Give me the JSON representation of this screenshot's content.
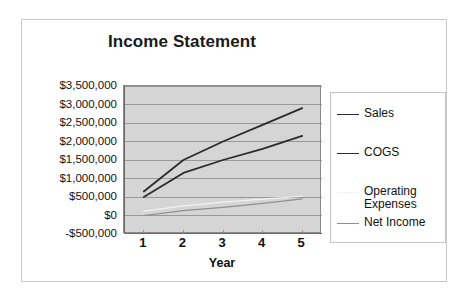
{
  "chart_data": {
    "type": "line",
    "title": "Income Statement",
    "xlabel": "Year",
    "ylabel": "",
    "x": [
      1,
      2,
      3,
      4,
      5
    ],
    "categories": [
      "1",
      "2",
      "3",
      "4",
      "5"
    ],
    "xtick_labels": [
      "1",
      "2",
      "3",
      "4",
      "5"
    ],
    "ytick_labels": [
      "$3,500,000",
      "$3,000,000",
      "$2,500,000",
      "$2,000,000",
      "$1,500,000",
      "$1,000,000",
      "$500,000",
      "$0",
      "-$500,000"
    ],
    "ytick_values": [
      3500000,
      3000000,
      2500000,
      2000000,
      1500000,
      1000000,
      500000,
      0,
      -500000
    ],
    "ylim": [
      -500000,
      3500000
    ],
    "xlim": [
      0.5,
      5.5
    ],
    "grid": true,
    "grid_axis": "y",
    "legend_position": "right",
    "plot_background": "#d5d5d5",
    "series": [
      {
        "name": "Sales",
        "color": "#2b2b2b",
        "width": 1.8,
        "values": [
          650000,
          1500000,
          2000000,
          2450000,
          2900000
        ]
      },
      {
        "name": "COGS",
        "color": "#2b2b2b",
        "width": 1.8,
        "values": [
          500000,
          1150000,
          1500000,
          1800000,
          2150000
        ]
      },
      {
        "name": "Operating\nExpenses",
        "color": "#f2f2f2",
        "width": 1.2,
        "values": [
          120000,
          260000,
          360000,
          440000,
          520000
        ]
      },
      {
        "name": "Net Income",
        "color": "#8f8f8f",
        "width": 1.2,
        "values": [
          0,
          130000,
          220000,
          330000,
          450000
        ]
      }
    ]
  },
  "legend": {
    "entries": [
      {
        "label": "Sales",
        "color": "#2b2b2b"
      },
      {
        "label": "COGS",
        "color": "#2b2b2b"
      },
      {
        "label": "Operating\nExpenses",
        "color": "#f2f2f2"
      },
      {
        "label": "Net Income",
        "color": "#8f8f8f"
      }
    ]
  },
  "colors": {
    "plot_bg": "#d5d5d5",
    "gridline": "#8a8a8a",
    "axis": "#555555",
    "frame_border": "#c9c9c9",
    "text": "#111111"
  }
}
